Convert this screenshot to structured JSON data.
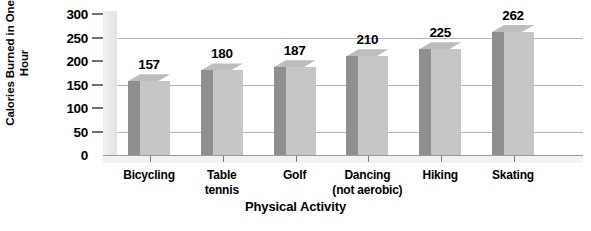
{
  "chart_data": {
    "type": "bar",
    "title": "",
    "subtitle": "",
    "xlabel": "Physical Activity",
    "ylabel": "Calories Burned in One Hour",
    "ylabel_line1": "Calories Burned",
    "ylabel_line2": "in One Hour",
    "categories": [
      "Bicycling",
      "Table tennis",
      "Golf",
      "Dancing (not aerobic)",
      "Hiking",
      "Skating"
    ],
    "category_lines": [
      [
        "Bicycling"
      ],
      [
        "Table",
        "tennis"
      ],
      [
        "Golf"
      ],
      [
        "Dancing",
        "(not aerobic)"
      ],
      [
        "Hiking"
      ],
      [
        "Skating"
      ]
    ],
    "values": [
      157,
      180,
      187,
      210,
      225,
      262
    ],
    "value_labels": [
      "157",
      "180",
      "187",
      "210",
      "225",
      "262"
    ],
    "ylim": [
      0,
      300
    ],
    "yticks": [
      300,
      250,
      200,
      150,
      100,
      50,
      0
    ],
    "ytick_labels": [
      "300",
      "250",
      "200",
      "150",
      "100",
      "50",
      "0"
    ],
    "gridlines_at": [
      250,
      150,
      50
    ],
    "grid": true,
    "legend": "none",
    "style": "3d-bars",
    "colors": {
      "bar_front": "#c6c6c6",
      "bar_side": "#8f8f8f",
      "bar_top": "#bdbdbd",
      "gridline": "#b4b4b4",
      "axis": "#6e6e6e",
      "text": "#000000",
      "background": "#ffffff",
      "wall": "#ececec"
    }
  }
}
